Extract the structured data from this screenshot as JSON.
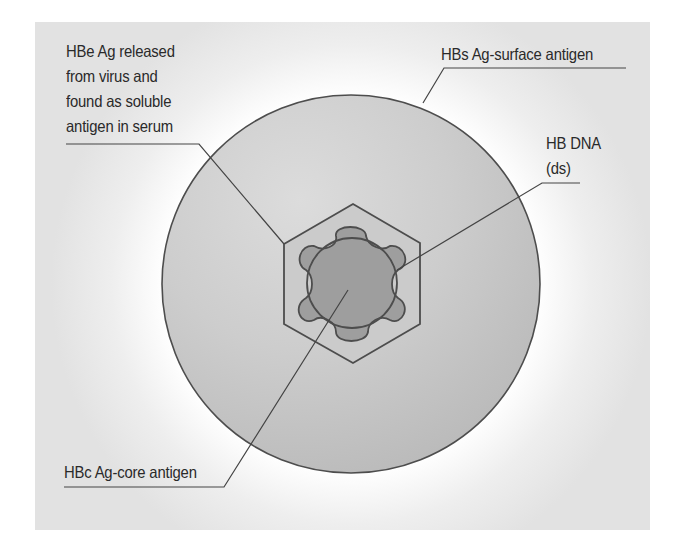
{
  "diagram": {
    "type": "labeled-structure",
    "colors": {
      "panel_background": "#e3e3e3",
      "glow": "#ffffff",
      "virion_fill": "#c6c6c6",
      "virion_highlight": "#dadada",
      "core_fill": "#9e9e9e",
      "outline": "#4d4d4d",
      "leader_line": "#444444",
      "text": "#2a2a2a"
    },
    "labels": {
      "hbe": {
        "lines": [
          "HBe Ag released",
          "from virus and",
          "found as soluble",
          "antigen in serum"
        ],
        "points_to": "hexagonal capsid"
      },
      "hbs": {
        "lines": [
          "HBs Ag-surface antigen"
        ],
        "points_to": "outer envelope"
      },
      "hbdna": {
        "lines": [
          "HB DNA",
          "(ds)"
        ],
        "points_to": "inner circular DNA"
      },
      "hbc": {
        "lines": [
          "HBc Ag-core antigen"
        ],
        "points_to": "core"
      }
    },
    "components": [
      {
        "name": "outer envelope",
        "shape": "circle"
      },
      {
        "name": "capsid",
        "shape": "hexagon"
      },
      {
        "name": "core",
        "shape": "six-lobed blob"
      },
      {
        "name": "DNA",
        "shape": "circle"
      }
    ]
  }
}
